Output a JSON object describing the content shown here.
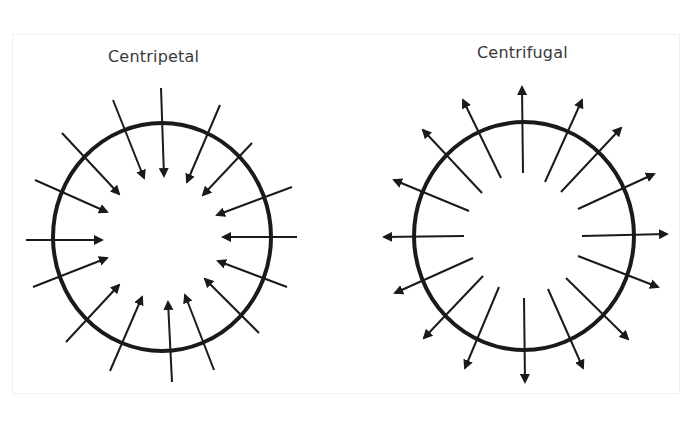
{
  "panels": [
    {
      "title": "Centripetal",
      "direction": "inward",
      "circle": {
        "cx": 162,
        "cy": 237,
        "rx": 109,
        "ry": 114
      },
      "arrows": [
        {
          "x1": 161,
          "y1": 88,
          "x2": 164,
          "y2": 176
        },
        {
          "x1": 113,
          "y1": 100,
          "x2": 144,
          "y2": 178
        },
        {
          "x1": 220,
          "y1": 105,
          "x2": 187,
          "y2": 182
        },
        {
          "x1": 62,
          "y1": 133,
          "x2": 119,
          "y2": 194
        },
        {
          "x1": 252,
          "y1": 143,
          "x2": 203,
          "y2": 195
        },
        {
          "x1": 35,
          "y1": 180,
          "x2": 107,
          "y2": 212
        },
        {
          "x1": 292,
          "y1": 187,
          "x2": 217,
          "y2": 215
        },
        {
          "x1": 26,
          "y1": 240,
          "x2": 102,
          "y2": 240
        },
        {
          "x1": 297,
          "y1": 237,
          "x2": 223,
          "y2": 237
        },
        {
          "x1": 33,
          "y1": 287,
          "x2": 107,
          "y2": 258
        },
        {
          "x1": 287,
          "y1": 287,
          "x2": 218,
          "y2": 261
        },
        {
          "x1": 66,
          "y1": 342,
          "x2": 119,
          "y2": 285
        },
        {
          "x1": 259,
          "y1": 333,
          "x2": 205,
          "y2": 279
        },
        {
          "x1": 110,
          "y1": 371,
          "x2": 142,
          "y2": 297
        },
        {
          "x1": 214,
          "y1": 370,
          "x2": 185,
          "y2": 295
        },
        {
          "x1": 172,
          "y1": 382,
          "x2": 168,
          "y2": 302
        }
      ]
    },
    {
      "title": "Centrifugal",
      "direction": "outward",
      "circle": {
        "cx": 524,
        "cy": 236,
        "rx": 110,
        "ry": 114
      },
      "arrows": [
        {
          "x1": 523,
          "y1": 173,
          "x2": 522,
          "y2": 87
        },
        {
          "x1": 501,
          "y1": 178,
          "x2": 463,
          "y2": 100
        },
        {
          "x1": 545,
          "y1": 182,
          "x2": 582,
          "y2": 100
        },
        {
          "x1": 482,
          "y1": 193,
          "x2": 423,
          "y2": 130
        },
        {
          "x1": 561,
          "y1": 192,
          "x2": 621,
          "y2": 128
        },
        {
          "x1": 469,
          "y1": 211,
          "x2": 394,
          "y2": 180
        },
        {
          "x1": 578,
          "y1": 209,
          "x2": 654,
          "y2": 174
        },
        {
          "x1": 464,
          "y1": 236,
          "x2": 384,
          "y2": 237
        },
        {
          "x1": 582,
          "y1": 236,
          "x2": 667,
          "y2": 234
        },
        {
          "x1": 473,
          "y1": 258,
          "x2": 395,
          "y2": 293
        },
        {
          "x1": 578,
          "y1": 256,
          "x2": 658,
          "y2": 287
        },
        {
          "x1": 483,
          "y1": 276,
          "x2": 424,
          "y2": 338
        },
        {
          "x1": 566,
          "y1": 278,
          "x2": 628,
          "y2": 339
        },
        {
          "x1": 499,
          "y1": 287,
          "x2": 465,
          "y2": 368
        },
        {
          "x1": 548,
          "y1": 289,
          "x2": 583,
          "y2": 368
        },
        {
          "x1": 524,
          "y1": 298,
          "x2": 525,
          "y2": 382
        }
      ]
    }
  ],
  "colors": {
    "stroke": "#1a1a1a",
    "title": "#3a3a3a",
    "background": "#ffffff"
  }
}
